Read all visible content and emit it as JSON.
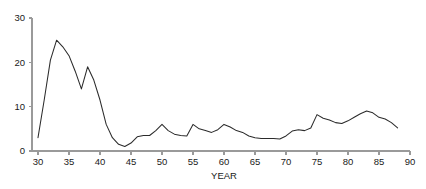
{
  "chart_data": {
    "type": "line",
    "title": "",
    "subtitle": "",
    "xlabel": "YEAR",
    "ylabel": "",
    "xlim": [
      30,
      90
    ],
    "ylim": [
      0,
      30
    ],
    "grid": false,
    "legend": null,
    "xticks": [
      30,
      35,
      40,
      45,
      50,
      55,
      60,
      65,
      70,
      75,
      80,
      85,
      90
    ],
    "xticklabels": [
      "30",
      "35",
      "40",
      "45",
      "50",
      "55",
      "60",
      "65",
      "70",
      "75",
      "80",
      "85",
      "90"
    ],
    "yticks": [
      0,
      10,
      20,
      30
    ],
    "yticklabels": [
      "0",
      "10",
      "20",
      "30"
    ],
    "series": [
      {
        "name": "series-1",
        "color": "#2b2b2b",
        "x": [
          30,
          31,
          32,
          33,
          34,
          35,
          36,
          37,
          38,
          39,
          40,
          41,
          42,
          43,
          44,
          45,
          46,
          47,
          48,
          49,
          50,
          51,
          52,
          53,
          54,
          55,
          56,
          57,
          58,
          59,
          60,
          61,
          62,
          63,
          64,
          65,
          66,
          67,
          68,
          69,
          70,
          71,
          72,
          73,
          74,
          75,
          76,
          77,
          78,
          79,
          80,
          81,
          82,
          83,
          84,
          85,
          86,
          87,
          88
        ],
        "values": [
          3.0,
          11.5,
          20.5,
          25.0,
          23.5,
          21.5,
          18.0,
          14.0,
          19.0,
          16.0,
          11.5,
          6.0,
          3.0,
          1.5,
          1.0,
          1.8,
          3.2,
          3.5,
          3.5,
          4.6,
          6.0,
          4.6,
          3.8,
          3.5,
          3.4,
          6.0,
          5.0,
          4.6,
          4.2,
          4.8,
          6.0,
          5.4,
          4.6,
          4.2,
          3.4,
          3.0,
          2.8,
          2.8,
          2.8,
          2.7,
          3.4,
          4.5,
          4.8,
          4.6,
          5.2,
          8.2,
          7.4,
          7.0,
          6.4,
          6.2,
          6.8,
          7.6,
          8.4,
          9.0,
          8.6,
          7.6,
          7.2,
          6.4,
          5.2
        ]
      }
    ]
  }
}
